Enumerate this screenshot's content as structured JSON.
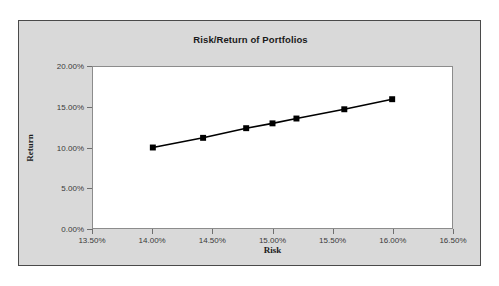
{
  "chart_data": {
    "type": "line",
    "title": "Risk/Return of Portfolios",
    "xlabel": "Risk",
    "ylabel": "Return",
    "x": [
      14.0,
      14.42,
      14.78,
      15.0,
      15.2,
      15.6,
      16.0
    ],
    "values": [
      10.0,
      11.2,
      12.4,
      13.0,
      13.6,
      14.75,
      16.0
    ],
    "series": [
      {
        "name": "Portfolios",
        "x": [
          14.0,
          14.42,
          14.78,
          15.0,
          15.2,
          15.6,
          16.0
        ],
        "values": [
          10.0,
          11.2,
          12.4,
          13.0,
          13.6,
          14.75,
          16.0
        ]
      }
    ],
    "xlim": [
      13.5,
      16.5
    ],
    "ylim": [
      0.0,
      20.0
    ],
    "xticks": [
      13.5,
      14.0,
      14.5,
      15.0,
      15.5,
      16.0,
      16.5
    ],
    "yticks": [
      0.0,
      5.0,
      10.0,
      15.0,
      20.0
    ],
    "xticklabels": [
      "13.50%",
      "14.00%",
      "14.50%",
      "15.00%",
      "15.50%",
      "16.00%",
      "16.50%"
    ],
    "yticklabels": [
      "0.00%",
      "5.00%",
      "10.00%",
      "15.00%",
      "20.00%"
    ],
    "grid": false,
    "legend": null,
    "marker": "square",
    "line_color": "#000000",
    "marker_color": "#000000",
    "plot_background": "#ffffff",
    "figure_background": "#d9d9d9"
  }
}
